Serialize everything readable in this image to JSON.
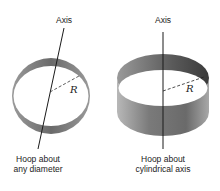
{
  "diagrams": [
    {
      "id": "hoop-diameter",
      "axis_label": "Axis",
      "radius_label": "R",
      "caption_line1": "Hoop about",
      "caption_line2": "any diameter"
    },
    {
      "id": "hoop-cylindrical",
      "axis_label": "Axis",
      "radius_label": "R",
      "caption_line1": "Hoop about",
      "caption_line2": "cylindrical axis"
    }
  ],
  "colors": {
    "band_dark": "#5a5a5a",
    "band_mid": "#8a8a8a",
    "band_light": "#c4c4c4",
    "line": "#1a1a1a"
  }
}
